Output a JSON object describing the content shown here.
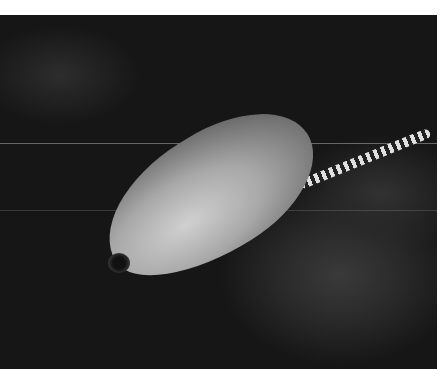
{
  "image": {
    "subject": "grouper fish swimming over dark reef with banded eel",
    "tone": "grayscale",
    "colors": {
      "background": "#161616",
      "fish": "#a8a8a8",
      "border": "#ffffff"
    }
  }
}
